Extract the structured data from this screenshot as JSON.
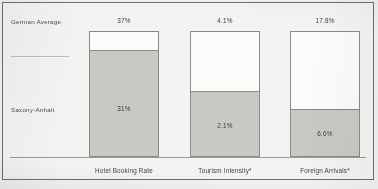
{
  "chart_data": {
    "type": "bar",
    "title": "",
    "subtitle": "",
    "xlabel": "",
    "ylabel": "",
    "grid": false,
    "legend_position": "left-axis-labels",
    "categories": [
      "Hotel Booking Rate",
      "Tourism Intensity*",
      "Foreign Arrivals*"
    ],
    "series": [
      {
        "name": "German Average",
        "values": [
          37,
          4.1,
          17.8
        ],
        "value_labels": [
          "37%",
          "4.1%",
          "17.8%"
        ],
        "color": "#fbfbfa"
      },
      {
        "name": "Saxony-Anhalt",
        "values": [
          31,
          2.1,
          6.6
        ],
        "value_labels": [
          "31%",
          "2.1%",
          "6.6%"
        ],
        "color": "#c9c8c5"
      }
    ],
    "annotations": [
      "* marked indicators carry a footnote"
    ],
    "ylim": [
      0,
      37
    ]
  },
  "axis_labels": {
    "german_average": "German  Average",
    "saxony_anhalt": "Saxony-Anhalt"
  },
  "colors": {
    "background": "#f2f1ef",
    "frame": "#6e6e6e",
    "bar_outline": "#8a8a8a",
    "bar_fill_saxony": "#c9c8c5",
    "bar_fill_german": "#fbfbfa",
    "axis": "#9a9a9a",
    "text": "#3d3d3d"
  }
}
